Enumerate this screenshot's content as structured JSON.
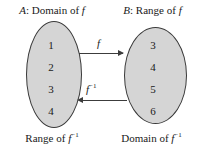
{
  "diagram": {
    "type": "function-inverse-mapping",
    "headers": {
      "left": {
        "set": "A",
        "separator": ": ",
        "text": "Domain of ",
        "symbol": "f"
      },
      "right": {
        "set": "B",
        "separator": ": ",
        "text": "Range of ",
        "symbol": "f"
      }
    },
    "footers": {
      "left": {
        "text": "Range of ",
        "symbol": "f",
        "exponent": "−1"
      },
      "right": {
        "text": "Domain of ",
        "symbol": "f",
        "exponent": "−1"
      }
    },
    "sets": {
      "a": {
        "label": "A",
        "members": [
          "1",
          "2",
          "3",
          "4"
        ]
      },
      "b": {
        "label": "B",
        "members": [
          "3",
          "4",
          "5",
          "6"
        ]
      }
    },
    "arrows": {
      "forward": {
        "label": "f",
        "exponent": "",
        "direction": "right"
      },
      "inverse": {
        "label": "f",
        "exponent": "−1",
        "direction": "left"
      }
    },
    "colors": {
      "ellipse_fill": "#d5d5d5",
      "ellipse_stroke": "#3a3a3a",
      "arrow": "#3c3c3c",
      "text": "#1a1a1a",
      "background": "#ffffff"
    }
  }
}
